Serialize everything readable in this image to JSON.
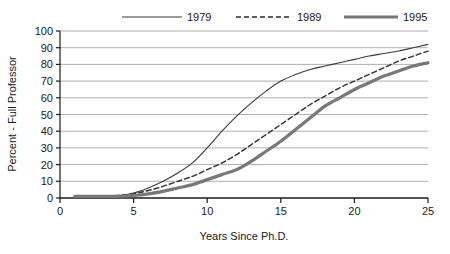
{
  "chart_data": {
    "type": "line",
    "title": "",
    "xlabel": "Years Since Ph.D.",
    "ylabel": "Percent - Full Professor",
    "xlim": [
      0,
      25
    ],
    "ylim": [
      0,
      100
    ],
    "xticks": [
      "0",
      "5",
      "10",
      "15",
      "20",
      "25"
    ],
    "xtick_values": [
      0,
      5,
      10,
      15,
      20,
      25
    ],
    "yticks": [
      "0",
      "10",
      "20",
      "30",
      "40",
      "50",
      "60",
      "70",
      "80",
      "90",
      "100"
    ],
    "ytick_values": [
      0,
      10,
      20,
      30,
      40,
      50,
      60,
      70,
      80,
      90,
      100
    ],
    "grid": "horizontal",
    "legend_position": "top",
    "x": [
      1,
      2,
      3,
      4,
      5,
      6,
      7,
      8,
      9,
      10,
      11,
      12,
      13,
      14,
      15,
      16,
      17,
      18,
      19,
      20,
      21,
      22,
      23,
      24,
      25
    ],
    "series": [
      {
        "name": "1979",
        "style": "solid-thin",
        "color": "#3a3a3a",
        "values": [
          1,
          1,
          1,
          1.5,
          3,
          6,
          10,
          15,
          21,
          30,
          40,
          49,
          57,
          64,
          70,
          74,
          77,
          79,
          81,
          83,
          85,
          86.5,
          88,
          90,
          92
        ]
      },
      {
        "name": "1989",
        "style": "dashed",
        "color": "#2e2e2e",
        "values": [
          1,
          1,
          1,
          1.5,
          2.5,
          4.5,
          7,
          10,
          13,
          17,
          21,
          26,
          32,
          38,
          44,
          50,
          56,
          61,
          66,
          70,
          74,
          78,
          82,
          85,
          88
        ]
      },
      {
        "name": "1995",
        "style": "solid-thick",
        "color": "#787878",
        "values": [
          1,
          1,
          1,
          1,
          1.5,
          2.5,
          4,
          6,
          8,
          11,
          14,
          17,
          22,
          28,
          34,
          41,
          48,
          55,
          60,
          65,
          69,
          73,
          76,
          79,
          81
        ]
      }
    ]
  },
  "legend": {
    "items": [
      {
        "label": "1979"
      },
      {
        "label": "1989"
      },
      {
        "label": "1995"
      }
    ]
  },
  "axes": {
    "x_title": "Years Since Ph.D.",
    "y_title": "Percent - Full Professor"
  }
}
